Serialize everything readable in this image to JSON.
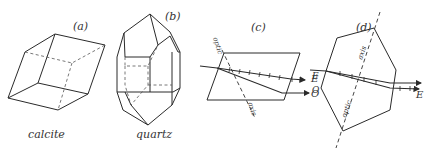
{
  "panels": [
    {
      "id": "a",
      "title": "(a)",
      "caption": "calcite"
    },
    {
      "id": "b",
      "title": "(b)",
      "caption": "quartz"
    },
    {
      "id": "c",
      "title": "(c)",
      "axis_label_top": "optic",
      "axis_label_bottom": "axis",
      "ray_labels": [
        "E",
        "O"
      ]
    },
    {
      "id": "d",
      "title": "(d)",
      "axis_label_top": "axis",
      "axis_label_bottom": "optic",
      "ray_labels_left": [
        "E",
        "O"
      ],
      "ray_labels_right": [
        "E"
      ]
    }
  ],
  "colors": {
    "line": "#2a2a2a",
    "background": "#ffffff"
  }
}
